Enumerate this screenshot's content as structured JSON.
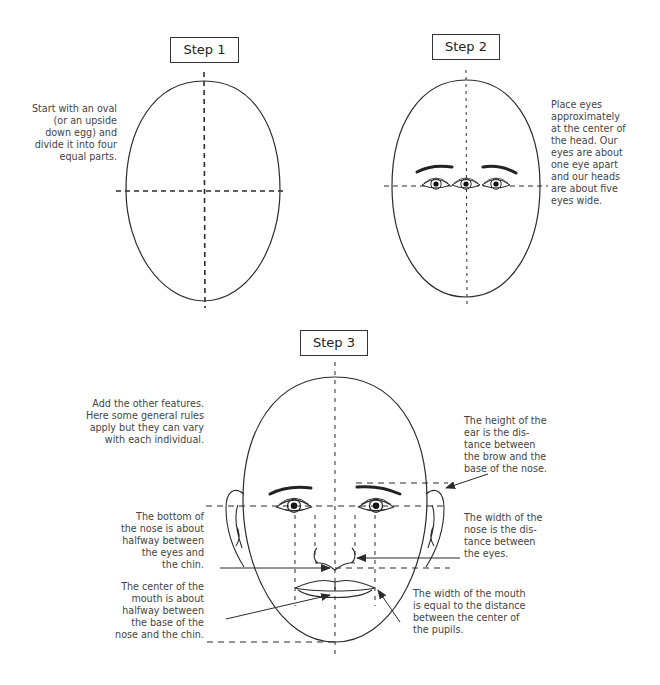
{
  "steps": [
    {
      "label": "Step 1",
      "notes": [
        "Start with an oval",
        "(or an upside",
        "down egg) and",
        "divide it into four",
        "equal parts."
      ]
    },
    {
      "label": "Step 2",
      "notes": [
        "Place eyes",
        "approximately",
        "at the center of",
        "the head. Our",
        "eyes are about",
        "one eye apart",
        "and our heads",
        "are about five",
        "eyes wide."
      ]
    },
    {
      "label": "Step 3",
      "notes": {
        "intro": [
          "Add the other features.",
          "Here some general rules",
          "apply but they can vary",
          "with each individual."
        ],
        "nose_bottom": [
          "The bottom of",
          "the nose is about",
          "halfway between",
          "the eyes and",
          "the chin."
        ],
        "mouth_center": [
          "The center of the",
          "mouth is about",
          "halfway between",
          "the base of the",
          "nose and the chin."
        ],
        "ear_height": [
          "The height of the",
          "ear is the dis-",
          "tance between",
          "the brow and the",
          "base of the nose."
        ],
        "nose_width": [
          "The width of the",
          "nose is the dis-",
          "tance between",
          "the eyes."
        ],
        "mouth_width": [
          "The width of the mouth",
          "is equal to the distance",
          "between the center of",
          "the pupils."
        ]
      }
    }
  ],
  "colors": {
    "line": "#2b2b2b",
    "text": "#444444"
  }
}
